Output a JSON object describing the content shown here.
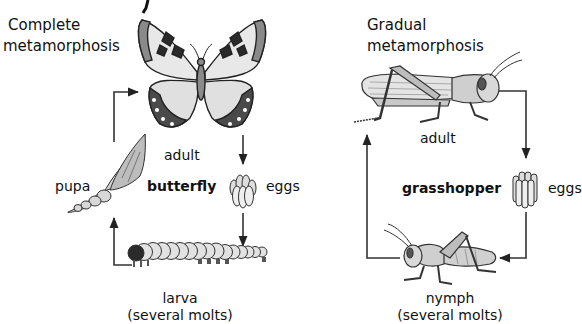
{
  "diagram": {
    "partial_top_glyph": "y",
    "left_panel": {
      "title_line1": "Complete",
      "title_line2": "metamorphosis",
      "center_label": "butterfly",
      "stages": {
        "adult": "adult",
        "eggs": "eggs",
        "larva": "larva",
        "larva_note": "(several molts)",
        "pupa": "pupa"
      },
      "cycle_order": [
        "adult",
        "eggs",
        "larva",
        "pupa",
        "adult"
      ]
    },
    "right_panel": {
      "title_line1": "Gradual",
      "title_line2": "metamorphosis",
      "center_label": "grasshopper",
      "stages": {
        "adult": "adult",
        "eggs": "eggs",
        "nymph": "nymph",
        "nymph_note": "(several molts)"
      },
      "cycle_order": [
        "adult",
        "eggs",
        "nymph",
        "adult"
      ]
    },
    "colors": {
      "line": "#333333",
      "fill_light": "#d9d9d9",
      "fill_mid": "#9a9a9a",
      "fill_dark": "#2a2a2a",
      "background": "#ffffff"
    }
  }
}
